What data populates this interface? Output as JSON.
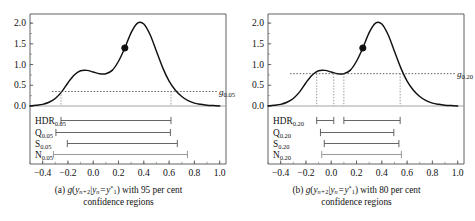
{
  "figure": {
    "panels": [
      {
        "id": "panel-a",
        "caption_line1": "(a) g(yₙ₊₂|yₙ = y*₁) with 95 per cent",
        "caption_line2": "confidence regions",
        "caption_label": "(a)",
        "caption_tail": "with 95 per cent",
        "threshold_label": "g",
        "threshold_sub": "0.05",
        "threshold_value": 0.35,
        "point_label": "mode-point",
        "point_x": 0.25,
        "point_y": 1.4,
        "interval_rows": [
          {
            "name": "HDR",
            "sub": "0.05",
            "segments": [
              [
                -0.255,
                0.615
              ]
            ]
          },
          {
            "name": "Q",
            "sub": "0.05",
            "segments": [
              [
                -0.295,
                0.61
              ]
            ]
          },
          {
            "name": "S",
            "sub": "0.05",
            "segments": [
              [
                -0.205,
                0.665
              ]
            ]
          },
          {
            "name": "N",
            "sub": "0.05",
            "segments": [
              [
                -0.315,
                0.745
              ]
            ]
          }
        ],
        "dotted_verticals": [
          -0.255,
          0.615
        ]
      },
      {
        "id": "panel-b",
        "caption_line1": "(b) g(yₙ₊₂|yₙ = y*₁) with 80 per cent",
        "caption_line2": "confidence regions",
        "caption_label": "(b)",
        "caption_tail": "with 80 per cent",
        "threshold_label": "g",
        "threshold_sub": "0.20",
        "threshold_value": 0.78,
        "point_label": "mode-point",
        "point_x": 0.25,
        "point_y": 1.4,
        "interval_rows": [
          {
            "name": "HDR",
            "sub": "0.20",
            "segments": [
              [
                -0.115,
                0.02
              ],
              [
                0.1,
                0.545
              ]
            ]
          },
          {
            "name": "Q",
            "sub": "0.20",
            "segments": [
              [
                -0.085,
                0.495
              ]
            ]
          },
          {
            "name": "S",
            "sub": "0.20",
            "segments": [
              [
                -0.055,
                0.535
              ]
            ]
          },
          {
            "name": "N",
            "sub": "0.20",
            "segments": [
              [
                -0.075,
                0.555
              ]
            ]
          }
        ],
        "dotted_verticals": [
          -0.115,
          0.02,
          0.1,
          0.545
        ]
      }
    ]
  },
  "chart_data": {
    "type": "line",
    "title": "",
    "xlabel": "",
    "ylabel": "",
    "xlim": [
      -0.5,
      1.05
    ],
    "ylim": [
      -0.18,
      2.25
    ],
    "xticks": [
      -0.4,
      -0.2,
      0.0,
      0.2,
      0.4,
      0.6,
      0.8,
      1.0
    ],
    "xticklabels": [
      "−0.4",
      "−0.2",
      "0.0",
      "0.2",
      "0.4",
      "0.6",
      "0.8",
      "1.0"
    ],
    "yticks": [
      0.0,
      0.5,
      1.0,
      1.5,
      2.0
    ],
    "yticklabels": [
      "0.0",
      "0.5",
      "1.0",
      "1.5",
      "2.0"
    ],
    "grid": false,
    "legend": "none",
    "series": [
      {
        "name": "g(y_{n+2} | y_n = y*_1)",
        "x": [
          -0.5,
          -0.45,
          -0.4,
          -0.35,
          -0.3,
          -0.25,
          -0.2,
          -0.15,
          -0.1,
          -0.05,
          0.0,
          0.05,
          0.1,
          0.15,
          0.2,
          0.25,
          0.3,
          0.35,
          0.4,
          0.45,
          0.5,
          0.55,
          0.6,
          0.65,
          0.7,
          0.75,
          0.8,
          0.85,
          0.9,
          0.95,
          1.0
        ],
        "y": [
          0.0,
          0.02,
          0.04,
          0.09,
          0.18,
          0.34,
          0.56,
          0.75,
          0.85,
          0.86,
          0.82,
          0.78,
          0.78,
          0.86,
          1.08,
          1.4,
          1.77,
          2.0,
          1.98,
          1.72,
          1.32,
          0.92,
          0.6,
          0.38,
          0.23,
          0.13,
          0.07,
          0.04,
          0.02,
          0.01,
          0.0
        ]
      }
    ],
    "annotations": [
      {
        "type": "point",
        "x": 0.25,
        "y": 1.4,
        "style": "filled-circle"
      },
      {
        "type": "hline",
        "panel": "a",
        "y": 0.35,
        "label": "g_0.05",
        "style": "dotted"
      },
      {
        "type": "hline",
        "panel": "b",
        "y": 0.78,
        "label": "g_0.20",
        "style": "dotted"
      }
    ]
  }
}
